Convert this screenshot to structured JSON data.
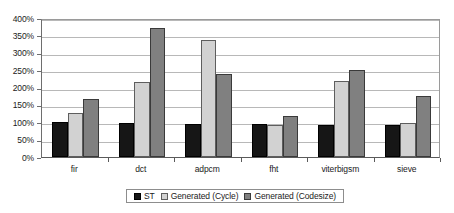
{
  "chart_data": {
    "type": "bar",
    "title": "",
    "subtitle": "",
    "xlabel": "",
    "ylabel": "",
    "categories": [
      "fir",
      "dct",
      "adpcm",
      "fht",
      "viterbigsm",
      "sieve"
    ],
    "series": [
      {
        "name": "ST",
        "color": "#161616",
        "values": [
          100,
          98,
          96,
          94,
          93,
          91
        ]
      },
      {
        "name": "Generated (Cycle)",
        "color": "#d2d2d2",
        "values": [
          128,
          215,
          336,
          91,
          220,
          99
        ]
      },
      {
        "name": "Generated (Codesize)",
        "color": "#808080",
        "values": [
          166,
          372,
          240,
          119,
          251,
          177
        ]
      }
    ],
    "ylim": [
      0,
      400
    ],
    "ytick_values": [
      0,
      50,
      100,
      150,
      200,
      250,
      300,
      350,
      400
    ],
    "ytick_labels": [
      "0%",
      "50%",
      "100%",
      "150%",
      "200%",
      "250%",
      "300%",
      "350%",
      "400%"
    ],
    "grid": true,
    "grid_axis": "y",
    "legend_position": "bottom",
    "value_unit": "percent"
  },
  "legend": {
    "entries": [
      {
        "label": "ST",
        "swatch": "legend-swatch-st"
      },
      {
        "label": "Generated (Cycle)",
        "swatch": "legend-swatch-generated-cycle"
      },
      {
        "label": "Generated (Codesize)",
        "swatch": "legend-swatch-generated-codesize"
      }
    ]
  },
  "colors": {
    "series_st": "#161616",
    "series_generated_cycle": "#d2d2d2",
    "series_generated_codesize": "#808080",
    "gridline": "#b8b8b8",
    "axis": "#5a5a5a",
    "text": "#1b1b1b",
    "background": "#ffffff"
  }
}
